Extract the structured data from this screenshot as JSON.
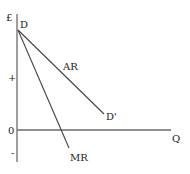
{
  "diagram": {
    "axes": {
      "y_label": "£",
      "x_label": "Q",
      "origin_label": "0",
      "positive_sign": "+",
      "negative_sign": "-"
    },
    "curves": [
      {
        "name": "AR",
        "label": "AR",
        "start_label": "D",
        "end_label": "D'",
        "description": "average revenue / demand curve"
      },
      {
        "name": "MR",
        "label": "MR",
        "description": "marginal revenue curve, twice as steep as AR, falls below zero"
      }
    ],
    "colors": {
      "axes": "#6a6a6a",
      "curves": "#444444",
      "text": "#222222"
    }
  }
}
